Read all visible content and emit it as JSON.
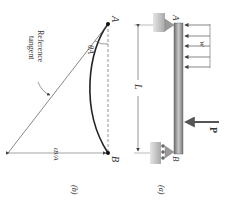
{
  "figure": {
    "orientation": "rotated 90 degrees clockwise",
    "panel_a": {
      "caption": "(a)",
      "point_a_label": "A",
      "point_b_label": "B",
      "distributed_load_label": "w",
      "point_load_label": "P",
      "span_label": "L",
      "support_a": "pin",
      "support_b": "roller"
    },
    "panel_b": {
      "caption": "(b)",
      "point_a_label": "A",
      "point_b_label": "B",
      "tangent_label_line1": "Reference",
      "tangent_label_line2": "tangent",
      "angle_label": "θA",
      "deviation_label": "tB/A"
    },
    "colors": {
      "ink": "#333333",
      "beam": "#8a8a8a",
      "support": "#b0b0b0",
      "load": "#555555"
    }
  }
}
